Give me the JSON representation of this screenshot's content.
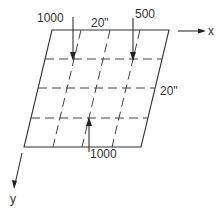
{
  "diagram": {
    "type": "plate-with-loads",
    "plate": {
      "corners": {
        "top_left": [
          52,
          30
        ],
        "top_right": [
          169,
          30
        ],
        "bottom_right": [
          141,
          147
        ],
        "bottom_left": [
          24,
          147
        ]
      },
      "grid_divisions": 4,
      "dimension_top": "20\"",
      "dimension_right": "20\""
    },
    "loads": [
      {
        "label": "1000",
        "direction": "down",
        "position": "top-left interior"
      },
      {
        "label": "500",
        "direction": "down",
        "position": "top-right interior"
      },
      {
        "label": "1000",
        "direction": "up",
        "position": "bottom-center"
      }
    ],
    "axes": {
      "x_label": "x",
      "y_label": "y"
    }
  }
}
